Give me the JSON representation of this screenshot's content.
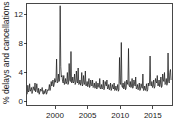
{
  "chart_data": {
    "type": "line",
    "title": "",
    "xlabel": "",
    "ylabel": "% delays and cancellations",
    "xlim": [
      1996.9,
      2017.2
    ],
    "ylim": [
      0,
      13.6
    ],
    "xticks": [
      2000,
      2005,
      2010,
      2015
    ],
    "xticklabels": [
      "2000",
      "2005",
      "2010",
      "2015"
    ],
    "yticks": [
      0,
      4,
      8,
      12
    ],
    "yticklabels": [
      "0",
      "4",
      "8",
      "12"
    ],
    "grid": false,
    "legend": false,
    "line_color": "#1a1a1a",
    "series": [
      {
        "name": "% delays and cancellations",
        "x": [
          1997.0,
          1997.083,
          1997.167,
          1997.25,
          1997.333,
          1997.417,
          1997.5,
          1997.583,
          1997.667,
          1997.75,
          1997.833,
          1997.917,
          1998.0,
          1998.083,
          1998.167,
          1998.25,
          1998.333,
          1998.417,
          1998.5,
          1998.583,
          1998.667,
          1998.75,
          1998.833,
          1998.917,
          1999.0,
          1999.083,
          1999.167,
          1999.25,
          1999.333,
          1999.417,
          1999.5,
          1999.583,
          1999.667,
          1999.75,
          1999.833,
          1999.917,
          2000.0,
          2000.083,
          2000.167,
          2000.25,
          2000.333,
          2000.417,
          2000.5,
          2000.583,
          2000.667,
          2000.75,
          2000.833,
          2000.917,
          2001.0,
          2001.083,
          2001.167,
          2001.25,
          2001.333,
          2001.417,
          2001.5,
          2001.583,
          2001.667,
          2001.75,
          2001.833,
          2001.917,
          2002.0,
          2002.083,
          2002.167,
          2002.25,
          2002.333,
          2002.417,
          2002.5,
          2002.583,
          2002.667,
          2002.75,
          2002.833,
          2002.917,
          2003.0,
          2003.083,
          2003.167,
          2003.25,
          2003.333,
          2003.417,
          2003.5,
          2003.583,
          2003.667,
          2003.75,
          2003.833,
          2003.917,
          2004.0,
          2004.083,
          2004.167,
          2004.25,
          2004.333,
          2004.417,
          2004.5,
          2004.583,
          2004.667,
          2004.75,
          2004.833,
          2004.917,
          2005.0,
          2005.083,
          2005.167,
          2005.25,
          2005.333,
          2005.417,
          2005.5,
          2005.583,
          2005.667,
          2005.75,
          2005.833,
          2005.917,
          2006.0,
          2006.083,
          2006.167,
          2006.25,
          2006.333,
          2006.417,
          2006.5,
          2006.583,
          2006.667,
          2006.75,
          2006.833,
          2006.917,
          2007.0,
          2007.083,
          2007.167,
          2007.25,
          2007.333,
          2007.417,
          2007.5,
          2007.583,
          2007.667,
          2007.75,
          2007.833,
          2007.917,
          2008.0,
          2008.083,
          2008.167,
          2008.25,
          2008.333,
          2008.417,
          2008.5,
          2008.583,
          2008.667,
          2008.75,
          2008.833,
          2008.917,
          2009.0,
          2009.083,
          2009.167,
          2009.25,
          2009.333,
          2009.417,
          2009.5,
          2009.583,
          2009.667,
          2009.75,
          2009.833,
          2009.917,
          2010.0,
          2010.083,
          2010.167,
          2010.25,
          2010.333,
          2010.417,
          2010.5,
          2010.583,
          2010.667,
          2010.75,
          2010.833,
          2010.917,
          2011.0,
          2011.083,
          2011.167,
          2011.25,
          2011.333,
          2011.417,
          2011.5,
          2011.583,
          2011.667,
          2011.75,
          2011.833,
          2011.917,
          2012.0,
          2012.083,
          2012.167,
          2012.25,
          2012.333,
          2012.417,
          2012.5,
          2012.583,
          2012.667,
          2012.75,
          2012.833,
          2012.917,
          2013.0,
          2013.083,
          2013.167,
          2013.25,
          2013.333,
          2013.417,
          2013.5,
          2013.583,
          2013.667,
          2013.75,
          2013.833,
          2013.917,
          2014.0,
          2014.083,
          2014.167,
          2014.25,
          2014.333,
          2014.417,
          2014.5,
          2014.583,
          2014.667,
          2014.75,
          2014.833,
          2014.917,
          2015.0,
          2015.083,
          2015.167,
          2015.25,
          2015.333,
          2015.417,
          2015.5,
          2015.583,
          2015.667,
          2015.75,
          2015.833,
          2015.917,
          2016.0,
          2016.083,
          2016.167,
          2016.25,
          2016.333,
          2016.417,
          2016.5,
          2016.583,
          2016.667,
          2016.75,
          2016.833,
          2016.917,
          2017.0
        ],
        "values": [
          1.5,
          2.7,
          1.8,
          2.0,
          2.9,
          1.9,
          2.1,
          2.4,
          1.6,
          1.9,
          2.5,
          2.2,
          2.0,
          3.0,
          1.8,
          2.1,
          2.9,
          2.0,
          1.7,
          2.3,
          1.5,
          1.8,
          2.2,
          1.9,
          2.0,
          2.4,
          1.6,
          1.5,
          2.0,
          1.6,
          1.8,
          2.2,
          1.5,
          1.7,
          2.1,
          2.0,
          2.2,
          2.8,
          2.0,
          2.4,
          3.2,
          2.6,
          3.0,
          3.4,
          2.5,
          2.8,
          3.6,
          3.1,
          3.4,
          6.2,
          3.0,
          3.1,
          4.2,
          3.2,
          3.4,
          13.3,
          5.2,
          3.8,
          4.0,
          3.2,
          3.0,
          4.0,
          2.8,
          3.0,
          3.6,
          2.9,
          3.2,
          4.4,
          2.8,
          3.0,
          5.6,
          3.4,
          3.2,
          7.2,
          3.0,
          3.1,
          3.8,
          3.0,
          3.2,
          4.2,
          2.8,
          3.0,
          4.6,
          3.2,
          3.0,
          5.0,
          2.8,
          2.9,
          3.4,
          2.7,
          3.0,
          4.4,
          2.6,
          2.8,
          4.0,
          3.0,
          2.8,
          4.6,
          2.6,
          2.7,
          3.2,
          2.5,
          2.8,
          3.6,
          2.4,
          2.6,
          3.4,
          2.8,
          2.6,
          3.4,
          2.4,
          2.5,
          3.0,
          2.3,
          2.5,
          3.2,
          2.2,
          2.4,
          3.0,
          2.6,
          2.4,
          3.6,
          2.2,
          2.3,
          2.8,
          2.2,
          2.4,
          3.4,
          2.1,
          2.3,
          3.2,
          2.8,
          2.6,
          3.4,
          2.2,
          2.3,
          2.8,
          2.1,
          2.3,
          3.0,
          2.0,
          2.2,
          2.8,
          2.4,
          2.2,
          3.0,
          2.0,
          2.1,
          2.6,
          2.0,
          2.2,
          2.8,
          1.9,
          2.1,
          6.4,
          3.0,
          2.8,
          8.4,
          2.6,
          2.4,
          3.0,
          2.2,
          2.4,
          3.2,
          2.1,
          2.3,
          3.4,
          3.0,
          2.8,
          7.6,
          2.6,
          2.5,
          3.2,
          2.4,
          2.6,
          3.6,
          2.3,
          2.5,
          3.4,
          3.0,
          2.6,
          3.8,
          2.2,
          2.3,
          2.8,
          2.1,
          2.3,
          3.0,
          2.0,
          2.2,
          2.9,
          2.5,
          2.3,
          4.2,
          2.0,
          2.1,
          2.6,
          2.0,
          2.2,
          2.9,
          1.9,
          2.1,
          3.0,
          2.6,
          3.0,
          6.6,
          2.8,
          2.6,
          3.2,
          2.4,
          2.6,
          3.4,
          2.3,
          2.5,
          3.6,
          3.2,
          3.0,
          4.0,
          2.6,
          2.7,
          3.4,
          2.5,
          2.8,
          3.8,
          2.4,
          2.6,
          4.2,
          3.4,
          3.2,
          4.4,
          2.8,
          2.9,
          3.6,
          2.7,
          3.0,
          7.0,
          3.2,
          3.0,
          4.4,
          4.8,
          3.4
        ]
      }
    ]
  },
  "axes": {
    "ylabel": "% delays and cancellations",
    "ytick_0": "0",
    "ytick_1": "4",
    "ytick_2": "8",
    "ytick_3": "12",
    "xtick_0": "2000",
    "xtick_1": "2005",
    "xtick_2": "2010",
    "xtick_3": "2015"
  }
}
